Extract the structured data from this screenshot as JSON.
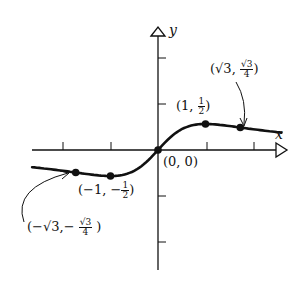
{
  "chart_data": {
    "type": "line",
    "title": "",
    "function": "y = x / (1 + x^2)",
    "xlabel": "x",
    "ylabel": "y",
    "xlim": [
      -2.7,
      2.7
    ],
    "ylim": [
      -2.6,
      2.6
    ],
    "x_ticks": [
      -2,
      -1,
      1,
      2
    ],
    "y_ticks": [
      -2,
      -1,
      1,
      2
    ],
    "grid": false,
    "legend": null,
    "labeled_points": [
      {
        "x": -1.732,
        "y": -0.433,
        "label": "(−√3, −√3/4)"
      },
      {
        "x": -1,
        "y": -0.5,
        "label": "(−1, −1/2)"
      },
      {
        "x": 0,
        "y": 0,
        "label": "(0, 0)"
      },
      {
        "x": 1,
        "y": 0.5,
        "label": "(1, 1/2)"
      },
      {
        "x": 1.732,
        "y": 0.433,
        "label": "(√3, √3/4)"
      }
    ]
  },
  "labels": {
    "x_axis": "x",
    "y_axis": "y",
    "origin": "(0, 0)",
    "p_max": {
      "open": "(1, ",
      "num": "1",
      "den": "2",
      "close": ")"
    },
    "p_min": {
      "open": "(−1, −",
      "num": "1",
      "den": "2",
      "close": ")"
    },
    "p_sqrt3": {
      "open": "(√3, ",
      "num": "√3",
      "den": "4",
      "close": ")"
    },
    "p_negsqrt3": {
      "open": "(−√3,− ",
      "num": "√3",
      "den": "4",
      "close": " )"
    }
  },
  "colors": {
    "ink": "#111111",
    "background": "#ffffff"
  }
}
